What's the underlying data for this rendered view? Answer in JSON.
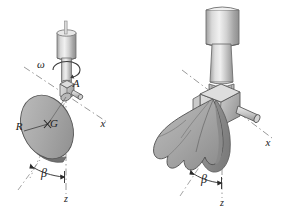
{
  "figure": {
    "background_color": "#ffffff",
    "line_color": "#1a1a1a",
    "dash_color": "#8c8c8c",
    "body_fill": "#a9a9a9",
    "body_fill_light": "#c4c4c4",
    "body_fill_dark": "#8f8f8f",
    "metal_light": "#e3e3e3",
    "metal_mid": "#bdbdbd",
    "metal_dark": "#9a9a9a",
    "panels": [
      {
        "id": "left-panel",
        "name": "undeformed-disk-figure",
        "labels": [
          {
            "name": "omega-label",
            "text": "ω",
            "x": 41,
            "y": 68,
            "size": 11,
            "italic": true
          },
          {
            "name": "point-a-label",
            "text": "A",
            "x": 76,
            "y": 87,
            "size": 11,
            "italic": true
          },
          {
            "name": "center-of-mass-label",
            "text": "G",
            "x": 52,
            "y": 124,
            "size": 11,
            "italic": true
          },
          {
            "name": "radius-label",
            "text": "R",
            "x": 19,
            "y": 130,
            "size": 11,
            "italic": true
          },
          {
            "name": "x-axis-label",
            "text": "x",
            "x": 101,
            "y": 127,
            "size": 11,
            "italic": true
          },
          {
            "name": "beta-angle-label",
            "text": "β",
            "x": 41,
            "y": 175,
            "size": 11,
            "italic": true
          },
          {
            "name": "z-axis-label",
            "text": "z",
            "x": 63,
            "y": 200,
            "size": 10,
            "italic": true
          }
        ]
      },
      {
        "id": "right-panel",
        "name": "deformed-disk-figure",
        "labels": [
          {
            "name": "x-axis-label",
            "text": "x",
            "x": 266,
            "y": 146,
            "size": 11,
            "italic": true
          },
          {
            "name": "beta-angle-label",
            "text": "β",
            "x": 202,
            "y": 181,
            "size": 11,
            "italic": true
          },
          {
            "name": "z-axis-label",
            "text": "z",
            "x": 222,
            "y": 206,
            "size": 10,
            "italic": true
          }
        ]
      }
    ],
    "symbol_glossary": [
      {
        "symbol": "ω",
        "meaning": "angular-velocity-of-shaft"
      },
      {
        "symbol": "A",
        "meaning": "pivot-point"
      },
      {
        "symbol": "G",
        "meaning": "center-of-mass"
      },
      {
        "symbol": "R",
        "meaning": "disk-radius"
      },
      {
        "symbol": "β",
        "meaning": "cone-angle-from-z-axis"
      },
      {
        "symbol": "x",
        "meaning": "x-axis"
      },
      {
        "symbol": "z",
        "meaning": "z-axis"
      }
    ]
  }
}
